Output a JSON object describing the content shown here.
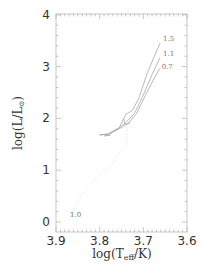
{
  "chart_data": {
    "type": "line",
    "title": "",
    "xlabel": "log(T_eff/K)",
    "ylabel": "log(L/L_⊙)",
    "xlim": [
      3.9,
      3.6
    ],
    "ylim": [
      -0.15,
      4.0
    ],
    "x_inverted": true,
    "x_ticks": [
      "3.9",
      "3.8",
      "3.7",
      "3.6"
    ],
    "y_ticks": [
      "0",
      "1",
      "2",
      "3",
      "4"
    ],
    "grid": false,
    "legend": "none (inline labels)",
    "series": [
      {
        "name": "1.5",
        "style": "solid",
        "points": [
          [
            3.8,
            1.68
          ],
          [
            3.78,
            1.7
          ],
          [
            3.755,
            1.82
          ],
          [
            3.745,
            2.0
          ],
          [
            3.74,
            2.08
          ],
          [
            3.725,
            2.15
          ],
          [
            3.71,
            2.4
          ],
          [
            3.69,
            2.9
          ],
          [
            3.662,
            3.45
          ]
        ]
      },
      {
        "name": "1.1",
        "style": "solid",
        "points": [
          [
            3.8,
            1.68
          ],
          [
            3.78,
            1.7
          ],
          [
            3.755,
            1.82
          ],
          [
            3.74,
            1.92
          ],
          [
            3.72,
            2.1
          ],
          [
            3.7,
            2.45
          ],
          [
            3.68,
            2.85
          ],
          [
            3.662,
            3.17
          ]
        ]
      },
      {
        "name": "0.7",
        "style": "solid",
        "points": [
          [
            3.78,
            1.69
          ],
          [
            3.755,
            1.8
          ],
          [
            3.735,
            1.9
          ],
          [
            3.715,
            2.1
          ],
          [
            3.695,
            2.45
          ],
          [
            3.675,
            2.78
          ],
          [
            3.662,
            2.97
          ]
        ]
      },
      {
        "name": "1.0",
        "style": "dotted",
        "points": [
          [
            3.87,
            0.05
          ],
          [
            3.84,
            0.55
          ],
          [
            3.8,
            0.9
          ],
          [
            3.77,
            1.15
          ],
          [
            3.74,
            1.5
          ],
          [
            3.735,
            1.9
          ]
        ]
      }
    ],
    "annotations": [
      {
        "text": "1.5",
        "x": 3.655,
        "y": 3.5
      },
      {
        "text": "1.1",
        "x": 3.655,
        "y": 3.2
      },
      {
        "text": "0.7",
        "x": 3.658,
        "y": 2.95
      },
      {
        "text": "1.0",
        "x": 3.868,
        "y": 0.1
      }
    ]
  },
  "axes": {
    "x_label_main": "log(T",
    "x_label_sub": "eff",
    "x_label_tail": "/K)",
    "y_label_main": "log(L/L",
    "y_label_sub": "⊙",
    "y_label_tail": ")"
  }
}
